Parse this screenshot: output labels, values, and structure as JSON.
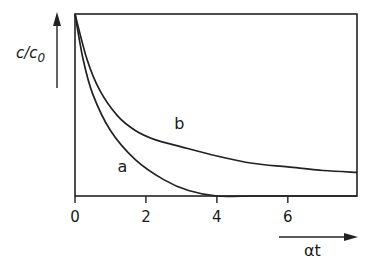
{
  "chart_data": {
    "type": "line",
    "title": "",
    "xlabel": "αt",
    "ylabel": "c / c0",
    "ylabel_main": "c/c",
    "ylabel_sub": "0",
    "xlim": [
      0,
      7.95
    ],
    "ylim": [
      0,
      1
    ],
    "x_ticks": [
      0,
      2,
      4,
      6
    ],
    "x_tick_labels": [
      "0",
      "2",
      "4",
      "6"
    ],
    "y_ticks": [],
    "grid": false,
    "legend": "inline curve labels",
    "series": [
      {
        "name": "a",
        "x": [
          0,
          0.23,
          0.5,
          1.0,
          1.7,
          2.5,
          3.2,
          4.0,
          5.0,
          7.95
        ],
        "y": [
          1.0,
          0.75,
          0.56,
          0.36,
          0.2,
          0.09,
          0.03,
          0.0,
          0.0,
          0.0
        ]
      },
      {
        "name": "b",
        "x": [
          0,
          0.34,
          0.7,
          1.2,
          1.7,
          2.25,
          3.0,
          4.0,
          5.0,
          6.0,
          7.0,
          7.95
        ],
        "y": [
          1.0,
          0.75,
          0.58,
          0.44,
          0.36,
          0.31,
          0.27,
          0.22,
          0.18,
          0.16,
          0.14,
          0.13
        ]
      }
    ],
    "annotations": [
      {
        "text": "a",
        "x": 1.2,
        "y": 0.13
      },
      {
        "text": "b",
        "x": 2.8,
        "y": 0.37
      }
    ]
  }
}
